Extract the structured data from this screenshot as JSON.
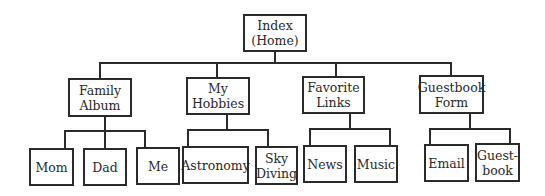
{
  "diagram": {
    "type": "site-map hierarchy",
    "root": {
      "label": "Index\n(Home)",
      "lines": [
        "Index",
        "(Home)"
      ]
    },
    "sections": [
      {
        "label": "Family Album",
        "lines": [
          "Family",
          "Album"
        ],
        "children": [
          {
            "lines": [
              "Mom"
            ]
          },
          {
            "lines": [
              "Dad"
            ]
          },
          {
            "lines": [
              "Me"
            ]
          }
        ]
      },
      {
        "label": "My Hobbies",
        "lines": [
          "My",
          "Hobbies"
        ],
        "children": [
          {
            "lines": [
              "Astronomy"
            ]
          },
          {
            "lines": [
              "Sky",
              "Diving"
            ]
          }
        ]
      },
      {
        "label": "Favorite Links",
        "lines": [
          "Favorite",
          "Links"
        ],
        "children": [
          {
            "lines": [
              "News"
            ]
          },
          {
            "lines": [
              "Music"
            ]
          }
        ]
      },
      {
        "label": "Guestbook Form",
        "lines": [
          "Guestbook",
          "Form"
        ],
        "children": [
          {
            "lines": [
              "Email"
            ]
          },
          {
            "lines": [
              "Guest-",
              "book"
            ]
          }
        ]
      }
    ]
  }
}
